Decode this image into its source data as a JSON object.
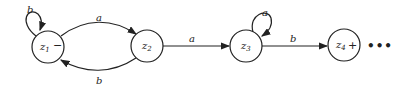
{
  "diagram": {
    "type": "finite-automaton",
    "states": [
      {
        "id": "z1",
        "label": "z",
        "sub": "1",
        "marker": "−",
        "role": "start"
      },
      {
        "id": "z2",
        "label": "z",
        "sub": "2",
        "marker": "",
        "role": "normal"
      },
      {
        "id": "z3",
        "label": "z",
        "sub": "3",
        "marker": "",
        "role": "normal"
      },
      {
        "id": "z4",
        "label": "z",
        "sub": "4",
        "marker": "+",
        "role": "final"
      }
    ],
    "transitions": [
      {
        "from": "z1",
        "to": "z1",
        "label": "b"
      },
      {
        "from": "z1",
        "to": "z2",
        "label": "a"
      },
      {
        "from": "z2",
        "to": "z1",
        "label": "b"
      },
      {
        "from": "z2",
        "to": "z3",
        "label": "a"
      },
      {
        "from": "z3",
        "to": "z3",
        "label": "a"
      },
      {
        "from": "z3",
        "to": "z4",
        "label": "b"
      }
    ],
    "continuation": "•••"
  }
}
